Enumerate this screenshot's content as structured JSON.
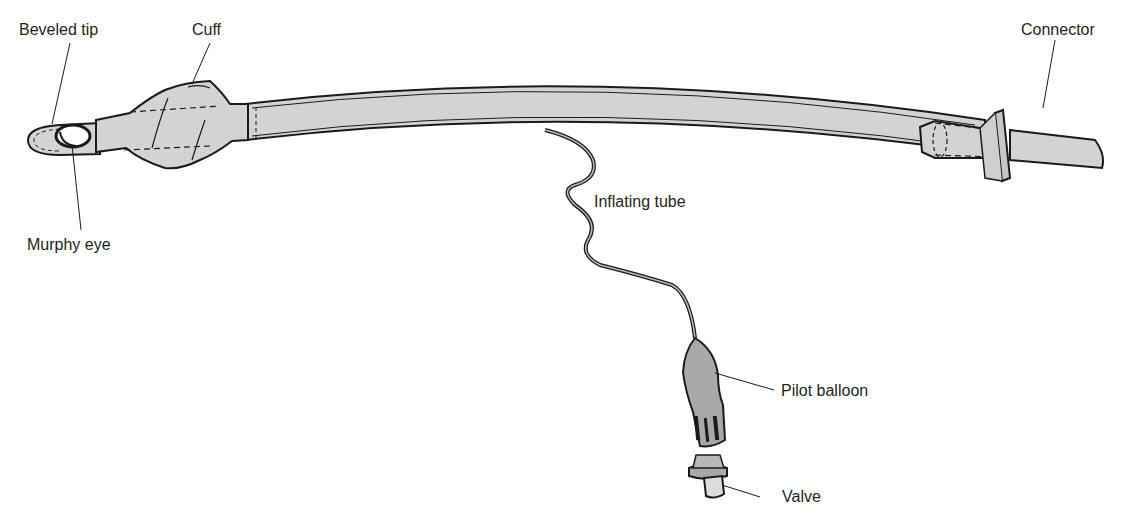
{
  "figure": {
    "colors": {
      "fill_light": "#d4d4d4",
      "fill_dark": "#a8a8a8",
      "outline": "#1a1a1a",
      "label_text": "#231f20",
      "background": "#ffffff"
    },
    "labels": [
      {
        "id": "beveled_tip",
        "text": "Beveled tip"
      },
      {
        "id": "cuff",
        "text": "Cuff"
      },
      {
        "id": "connector",
        "text": "Connector"
      },
      {
        "id": "murphy_eye",
        "text": "Murphy eye"
      },
      {
        "id": "inflating_tube",
        "text": "Inflating tube"
      },
      {
        "id": "pilot_balloon",
        "text": "Pilot balloon"
      },
      {
        "id": "valve",
        "text": "Valve"
      }
    ]
  }
}
